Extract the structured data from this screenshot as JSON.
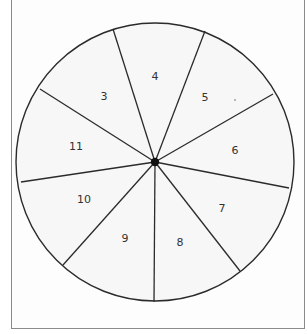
{
  "diagram": {
    "type": "spinner-wheel",
    "center": {
      "x": 155,
      "y": 162
    },
    "radius": 139,
    "spoke_endpoints": [
      {
        "x": 113,
        "y": 29
      },
      {
        "x": 205,
        "y": 31
      },
      {
        "x": 273,
        "y": 94
      },
      {
        "x": 289,
        "y": 188
      },
      {
        "x": 240,
        "y": 271
      },
      {
        "x": 154,
        "y": 302
      },
      {
        "x": 63,
        "y": 265
      },
      {
        "x": 21,
        "y": 182
      },
      {
        "x": 40,
        "y": 89
      }
    ],
    "sections": [
      {
        "label": "4",
        "x": 155,
        "y": 77
      },
      {
        "label": "5",
        "x": 205,
        "y": 98
      },
      {
        "label": "6",
        "x": 235,
        "y": 151
      },
      {
        "label": "7",
        "x": 222,
        "y": 209
      },
      {
        "label": "8",
        "x": 180,
        "y": 243
      },
      {
        "label": "9",
        "x": 125,
        "y": 239
      },
      {
        "label": "10",
        "x": 84,
        "y": 200
      },
      {
        "label": "11",
        "x": 76,
        "y": 147
      },
      {
        "label": "3",
        "x": 104,
        "y": 97
      }
    ],
    "stray_mark": {
      "x": 235,
      "y": 100
    },
    "colors": {
      "line": "#2b2b2b",
      "fill": "#f7f7f7",
      "hub": "#111111",
      "border": "#8a8a8a"
    }
  }
}
